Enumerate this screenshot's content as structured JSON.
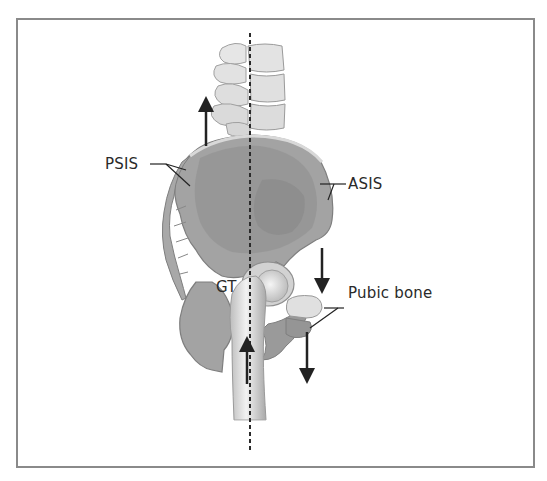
{
  "figure": {
    "labels": {
      "psis": "PSIS",
      "asis": "ASIS",
      "gt": "GT",
      "pubic_bone": "Pubic bone"
    },
    "arrows": [
      {
        "id": "posterior-up",
        "direction": "up"
      },
      {
        "id": "anterior-down-upper",
        "direction": "down"
      },
      {
        "id": "anterior-down-lower",
        "direction": "down"
      },
      {
        "id": "femur-up",
        "direction": "up"
      }
    ],
    "reference_line": "dashed-vertical-plumb-line",
    "colors": {
      "frame_border": "#8a8a8a",
      "bone_light": "#e4e4e4",
      "bone_mid": "#bdbdbd",
      "pelvis_dark": "#8c8c8c",
      "pelvis_fill": "#9e9e9e",
      "arrow": "#222222",
      "text": "#2a2a2a"
    }
  }
}
